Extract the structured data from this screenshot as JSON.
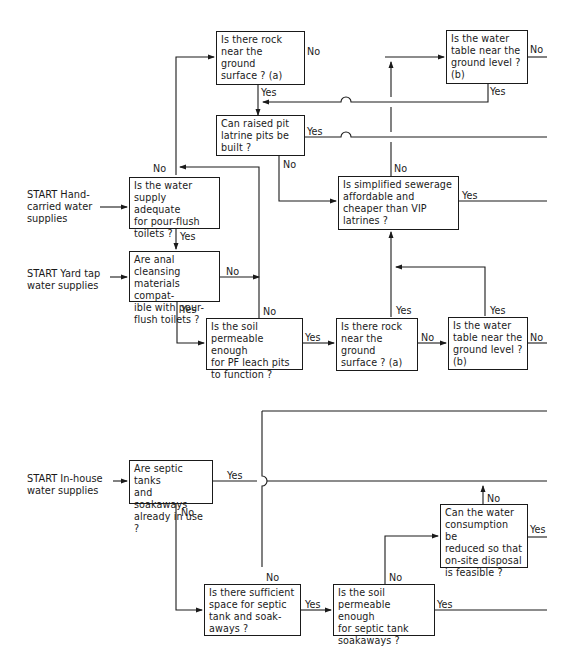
{
  "diagram": {
    "type": "flowchart",
    "colors": {
      "line": "#1a1a1a",
      "background": "#ffffff"
    },
    "starts": {
      "hand_carried": "START Hand-\ncarried water\nsupplies",
      "yard_tap": "START Yard tap\nwater supplies",
      "in_house": "START In-house\nwater supplies"
    },
    "nodes": {
      "rock_top": "Is there rock\nnear the ground\nsurface ? (a)",
      "water_table_top": "Is the water\ntable near the\nground level ?\n(b)",
      "raised_pit": "Can raised pit\nlatrine pits be\nbuilt ?",
      "water_supply": "Is the water\nsupply adequate\nfor pour-flush\ntoilets ?",
      "simplified_sewerage": "Is simplified sewerage\naffordable and\ncheaper than VIP\nlatrines ?",
      "anal_cleansing": "Are anal cleansing\nmaterials compat-\nible with pour-\nflush toilets ?",
      "soil_pf": "Is the soil\npermeable enough\nfor PF leach pits\nto function ?",
      "rock_mid": "Is there rock\nnear the ground\nsurface ? (a)",
      "water_table_mid": "Is the water\ntable near the\nground level ?\n(b)",
      "septic_in_use": "Are septic tanks\nand soakaways\nalready in use ?",
      "water_consumption": "Can the water\nconsumption be\nreduced so that\non-site disposal\nis feasible ?",
      "sufficient_space": "Is there sufficient\nspace for septic\ntank and soak-\naways ?",
      "soil_septic": "Is the soil\npermeable enough\nfor septic tank\nsoakaways ?"
    },
    "labels": {
      "yes": "Yes",
      "no": "No"
    }
  }
}
